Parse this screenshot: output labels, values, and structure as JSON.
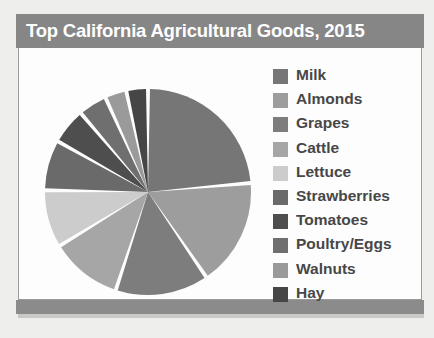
{
  "header": {
    "title": "Top California Agricultural Goods, 2015",
    "bar_color": "#868686",
    "text_color": "#ffffff"
  },
  "panel": {
    "background": "#fdfdfd",
    "border_color": "#9a9a9a",
    "footer_bar_color": "#8b8b8b"
  },
  "chart_data": {
    "type": "pie",
    "title": "Top California Agricultural Goods, 2015",
    "xlabel": "",
    "ylabel": "",
    "legend_position": "right",
    "grid": false,
    "start_angle_clock": "12 o'clock",
    "direction": "clockwise",
    "categories": [
      "Milk",
      "Almonds",
      "Grapes",
      "Cattle",
      "Lettuce",
      "Strawberries",
      "Tomatoes",
      "Poultry/Eggs",
      "Walnuts",
      "Hay"
    ],
    "values": [
      21,
      15,
      13,
      10,
      8,
      7,
      5,
      4,
      3,
      3
    ],
    "colors": [
      "#767676",
      "#9d9d9d",
      "#7d7d7d",
      "#a6a6a6",
      "#cccccc",
      "#6a6a6a",
      "#4e4e4e",
      "#6f6f6f",
      "#9a9a9a",
      "#464646"
    ],
    "slice_gap_color": "#fdfdfd"
  },
  "legend": {
    "items": [
      {
        "label": "Milk",
        "color": "#767676"
      },
      {
        "label": "Almonds",
        "color": "#9d9d9d"
      },
      {
        "label": "Grapes",
        "color": "#7d7d7d"
      },
      {
        "label": "Cattle",
        "color": "#a6a6a6"
      },
      {
        "label": "Lettuce",
        "color": "#cccccc"
      },
      {
        "label": "Strawberries",
        "color": "#6a6a6a"
      },
      {
        "label": "Tomatoes",
        "color": "#4e4e4e"
      },
      {
        "label": "Poultry/Eggs",
        "color": "#6f6f6f"
      },
      {
        "label": "Walnuts",
        "color": "#9a9a9a"
      },
      {
        "label": "Hay",
        "color": "#464646"
      }
    ]
  }
}
